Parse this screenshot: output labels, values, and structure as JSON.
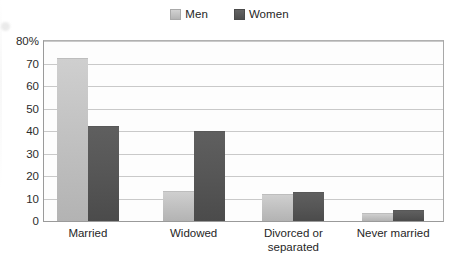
{
  "chart_data": {
    "type": "bar",
    "title": "",
    "xlabel": "",
    "ylabel": "",
    "categories": [
      "Married",
      "Widowed",
      "Divorced or separated",
      "Never married"
    ],
    "category_lines": [
      [
        "Married"
      ],
      [
        "Widowed"
      ],
      [
        "Divorced or",
        "separated"
      ],
      [
        "Never married"
      ]
    ],
    "series": [
      {
        "name": "Men",
        "values": [
          72,
          13,
          11.5,
          3
        ],
        "color": "#c4c4c4"
      },
      {
        "name": "Women",
        "values": [
          42,
          39.5,
          12.5,
          4.5
        ],
        "color": "#565656"
      }
    ],
    "ylim": [
      0,
      80
    ],
    "yticks": [
      0,
      10,
      20,
      30,
      40,
      50,
      60,
      70,
      80
    ],
    "ytick_labels": [
      "0",
      "10",
      "20",
      "30",
      "40",
      "50",
      "60",
      "70",
      "80%"
    ],
    "grid": true,
    "legend_position": "top-center"
  },
  "legend": {
    "items": [
      {
        "label": "Men",
        "swatch": "men-swatch-icon"
      },
      {
        "label": "Women",
        "swatch": "women-swatch-icon"
      }
    ]
  }
}
